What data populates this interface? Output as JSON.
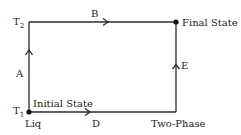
{
  "diagram": {
    "type": "process-path",
    "colors": {
      "line": "#2a2a2a",
      "text": "#222222",
      "background": "#ffffff"
    },
    "nodes": {
      "t2": {
        "label": "T",
        "subscript": "2"
      },
      "t1": {
        "label": "T",
        "subscript": "1"
      },
      "initial": {
        "label": "Initial State"
      },
      "final": {
        "label": "Final State"
      },
      "liq": {
        "label": "Liq"
      },
      "two_phase": {
        "label": "Two-Phase"
      }
    },
    "edges": {
      "a": {
        "label": "A",
        "from": "Initial State",
        "to": "T2 corner",
        "direction": "up"
      },
      "b": {
        "label": "B",
        "from": "T2 corner",
        "to": "Final State",
        "direction": "right"
      },
      "d": {
        "label": "D",
        "from": "Initial State",
        "to": "Two-Phase corner",
        "direction": "right"
      },
      "e": {
        "label": "E",
        "from": "Two-Phase corner",
        "to": "Final State",
        "direction": "up"
      }
    }
  }
}
